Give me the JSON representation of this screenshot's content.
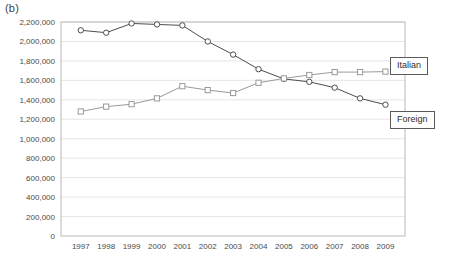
{
  "panel": {
    "label": "(b)"
  },
  "legend": {
    "position": "right-outside",
    "entries": [
      {
        "name": "italian",
        "label": "Italian"
      },
      {
        "name": "foreign",
        "label": "Foreign"
      }
    ]
  },
  "chart_data": {
    "type": "line",
    "title": "",
    "subtitle": "",
    "xlabel": "",
    "ylabel": "",
    "grid": true,
    "gridlines": "horizontal",
    "legend_position": "right",
    "categories": [
      "1997",
      "1998",
      "1999",
      "2000",
      "2001",
      "2002",
      "2003",
      "2004",
      "2005",
      "2006",
      "2007",
      "2008",
      "2009"
    ],
    "x": [
      1997,
      1998,
      1999,
      2000,
      2001,
      2002,
      2003,
      2004,
      2005,
      2006,
      2007,
      2008,
      2009
    ],
    "xlim": [
      1996.5,
      2009.5
    ],
    "ylim": [
      0,
      2200000
    ],
    "ytick_step": 200000,
    "ytick_labels": [
      "0",
      "200,000",
      "400,000",
      "600,000",
      "800,000",
      "1,000,000",
      "1,200,000",
      "1,400,000",
      "1,600,000",
      "1,800,000",
      "2,000,000",
      "2,200,000"
    ],
    "ytick_values": [
      0,
      200000,
      400000,
      600000,
      800000,
      1000000,
      1200000,
      1400000,
      1600000,
      1800000,
      2000000,
      2200000
    ],
    "series": [
      {
        "name": "Italian",
        "marker": "circle",
        "color": "#4d4d4d",
        "values": [
          2115000,
          2090000,
          2185000,
          2175000,
          2165000,
          2000000,
          1865000,
          1715000,
          1615000,
          1585000,
          1525000,
          1415000,
          1350000
        ]
      },
      {
        "name": "Foreign",
        "marker": "square",
        "color": "#9a9a9a",
        "values": [
          1280000,
          1330000,
          1355000,
          1415000,
          1540000,
          1500000,
          1470000,
          1575000,
          1620000,
          1655000,
          1685000,
          1685000,
          1690000
        ]
      }
    ]
  },
  "colors": {
    "italian_line": "#4d4d4d",
    "foreign_line": "#9a9a9a",
    "frame": "#b9b9b9",
    "gridline": "#e6e6e6",
    "axis_text": "#4a4a4a",
    "legend_border": "#5a5a5a",
    "background": "#ffffff"
  }
}
